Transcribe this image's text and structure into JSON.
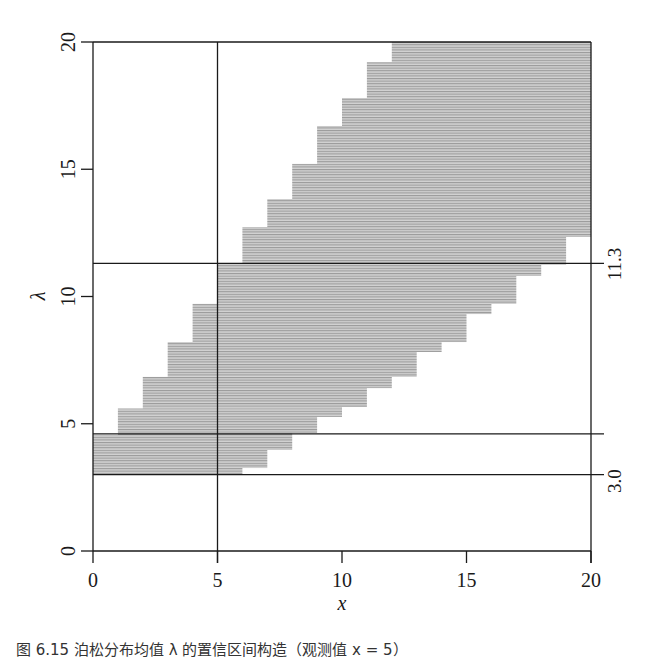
{
  "chart_data": {
    "type": "area",
    "title": "",
    "xlabel": "x",
    "ylabel": "λ",
    "xlim": [
      0,
      20
    ],
    "ylim": [
      0,
      20
    ],
    "x_ticks": [
      0,
      5,
      10,
      15,
      20
    ],
    "y_ticks": [
      0,
      5,
      10,
      15,
      20
    ],
    "grid": false,
    "belt_left_edge": [
      {
        "lambda_from": 3.0,
        "lambda_to": 4.56,
        "x": 0
      },
      {
        "lambda_from": 4.56,
        "lambda_to": 5.6,
        "x": 1
      },
      {
        "lambda_from": 5.6,
        "lambda_to": 6.84,
        "x": 2
      },
      {
        "lambda_from": 6.84,
        "lambda_to": 8.21,
        "x": 3
      },
      {
        "lambda_from": 8.21,
        "lambda_to": 9.71,
        "x": 4
      },
      {
        "lambda_from": 9.71,
        "lambda_to": 11.28,
        "x": 5
      },
      {
        "lambda_from": 11.28,
        "lambda_to": 12.73,
        "x": 6
      },
      {
        "lambda_from": 12.73,
        "lambda_to": 13.83,
        "x": 7
      },
      {
        "lambda_from": 13.83,
        "lambda_to": 15.21,
        "x": 8
      },
      {
        "lambda_from": 15.21,
        "lambda_to": 16.7,
        "x": 9
      },
      {
        "lambda_from": 16.7,
        "lambda_to": 17.8,
        "x": 10
      },
      {
        "lambda_from": 17.8,
        "lambda_to": 19.21,
        "x": 11
      },
      {
        "lambda_from": 19.21,
        "lambda_to": 20.0,
        "x": 12
      }
    ],
    "belt_right_edge": [
      {
        "lambda_from": 3.0,
        "lambda_to": 3.26,
        "x": 6
      },
      {
        "lambda_from": 3.26,
        "lambda_to": 3.97,
        "x": 7
      },
      {
        "lambda_from": 3.97,
        "lambda_to": 4.64,
        "x": 8
      },
      {
        "lambda_from": 4.64,
        "lambda_to": 5.27,
        "x": 9
      },
      {
        "lambda_from": 5.27,
        "lambda_to": 5.66,
        "x": 10
      },
      {
        "lambda_from": 5.66,
        "lambda_to": 6.4,
        "x": 11
      },
      {
        "lambda_from": 6.4,
        "lambda_to": 6.84,
        "x": 12
      },
      {
        "lambda_from": 6.84,
        "lambda_to": 7.82,
        "x": 13
      },
      {
        "lambda_from": 7.82,
        "lambda_to": 8.21,
        "x": 14
      },
      {
        "lambda_from": 8.21,
        "lambda_to": 9.31,
        "x": 15
      },
      {
        "lambda_from": 9.31,
        "lambda_to": 9.71,
        "x": 16
      },
      {
        "lambda_from": 9.71,
        "lambda_to": 10.81,
        "x": 17
      },
      {
        "lambda_from": 10.81,
        "lambda_to": 11.24,
        "x": 18
      },
      {
        "lambda_from": 11.24,
        "lambda_to": 12.34,
        "x": 19
      },
      {
        "lambda_from": 12.34,
        "lambda_to": 20.0,
        "x": 20
      }
    ],
    "reference_lines": {
      "vertical": [
        {
          "x": 5
        }
      ],
      "horizontal": [
        {
          "y": 11.3,
          "label": "11.3"
        },
        {
          "y": 4.6,
          "label": ""
        },
        {
          "y": 3.0,
          "label": "3.0"
        }
      ]
    },
    "fill_color": "#b4b4b4",
    "line_color": "#1a1a1a"
  },
  "labels": {
    "xlabel": "x",
    "ylabel": "λ",
    "right_label_upper": "11.3",
    "right_label_lower": "3.0",
    "x_tick_labels": [
      "0",
      "5",
      "10",
      "15",
      "20"
    ],
    "y_tick_labels": [
      "0",
      "5",
      "10",
      "15",
      "20"
    ],
    "caption": "图 6.15 泊松分布均值 λ 的置信区间构造（观测值 x = 5）"
  }
}
